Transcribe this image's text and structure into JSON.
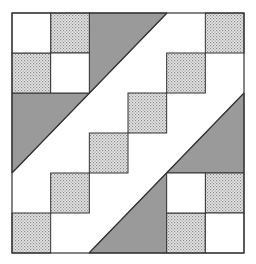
{
  "colors": {
    "background": "#ffffff",
    "dark": "#9a9a9a",
    "dotted_base": "#e6e6e6",
    "dotted_dot": "#8a8a8a",
    "line": "#333333"
  },
  "block": {
    "x": 12,
    "y": 13,
    "width": 232,
    "height": 240,
    "grid_cols": 6,
    "grid_rows": 6
  },
  "dark_shapes": [
    {
      "name": "top-left-dark-band",
      "points": "89,13 167,13 12,173 12,93 89,93"
    },
    {
      "name": "bottom-right-dark-band",
      "points": "244,93 244,173 167,173 167,253 89,253"
    }
  ],
  "dotted_squares": [
    {
      "col": 1,
      "row": 0
    },
    {
      "col": 0,
      "row": 1
    },
    {
      "col": 5,
      "row": 0
    },
    {
      "col": 4,
      "row": 1
    },
    {
      "col": 3,
      "row": 2
    },
    {
      "col": 2,
      "row": 3
    },
    {
      "col": 1,
      "row": 4
    },
    {
      "col": 0,
      "row": 5
    },
    {
      "col": 5,
      "row": 4
    },
    {
      "col": 4,
      "row": 5
    }
  ],
  "white_squares": [
    {
      "col": 0,
      "row": 0
    },
    {
      "col": 1,
      "row": 1
    },
    {
      "col": 4,
      "row": 4
    },
    {
      "col": 5,
      "row": 5
    }
  ],
  "diagonals": [
    {
      "x1": 167,
      "y1": 13,
      "x2": 12,
      "y2": 173
    },
    {
      "x1": 244,
      "y1": 93,
      "x2": 89,
      "y2": 253
    }
  ]
}
